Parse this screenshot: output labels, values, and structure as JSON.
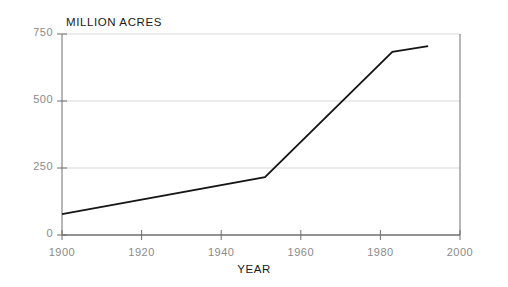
{
  "chart_data": {
    "type": "line",
    "title": "",
    "ylabel": "MILLION ACRES",
    "xlabel": "YEAR",
    "xlim": [
      1900,
      2000
    ],
    "ylim": [
      0,
      750
    ],
    "xticks": [
      1900,
      1920,
      1940,
      1960,
      1980,
      2000
    ],
    "xtick_labels": [
      "1900",
      "1920",
      "1940",
      "1960",
      "1980",
      "2000"
    ],
    "yticks": [
      0,
      250,
      500,
      750
    ],
    "ytick_labels": [
      "0",
      "250",
      "500",
      "750"
    ],
    "grid": true,
    "grid_axis": "y",
    "legend": false,
    "series": [
      {
        "name": "Million Acres",
        "x": [
          1900,
          1951,
          1983,
          1992
        ],
        "values": [
          78,
          216,
          683,
          705
        ]
      }
    ],
    "points": [
      {
        "x": 1900,
        "y": 78
      },
      {
        "x": 1951,
        "y": 216
      },
      {
        "x": 1983,
        "y": 683
      },
      {
        "x": 1992,
        "y": 705
      }
    ],
    "colors": {
      "line": "#151515",
      "grid": "#d9d9d9",
      "axis": "#6e6e6e",
      "tick_text": "#8a8a8a",
      "title_text": "#1a1a1a",
      "background": "#ffffff"
    }
  }
}
